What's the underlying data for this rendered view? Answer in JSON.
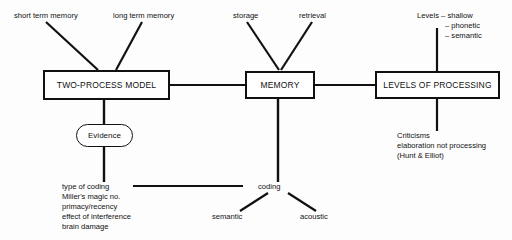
{
  "diagram": {
    "type": "concept-map",
    "background_color": "#fdfdfd",
    "line_color": "#111111",
    "text_color": "#111111",
    "nodes": {
      "two_process_model": "TWO-PROCESS MODEL",
      "memory": "MEMORY",
      "levels_of_processing": "LEVELS OF PROCESSING",
      "evidence": "Evidence",
      "coding": "coding"
    },
    "labels": {
      "short_term_memory": "short term memory",
      "long_term_memory": "long term memory",
      "storage": "storage",
      "retrieval": "retrieval",
      "semantic": "semantic",
      "acoustic": "acoustic"
    },
    "levels_list": {
      "line1": "Levels – shallow",
      "line2": "– phonetic",
      "line3": "– semantic"
    },
    "evidence_list": {
      "line1": "type of coding",
      "line2": "Miller's magic no.",
      "line3": "primacy/recency",
      "line4": "effect of interference",
      "line5": "brain damage"
    },
    "criticisms": {
      "line1": "Criticisms",
      "line2": "elaboration not processing",
      "line3": "(Hunt & Elliot)"
    }
  }
}
